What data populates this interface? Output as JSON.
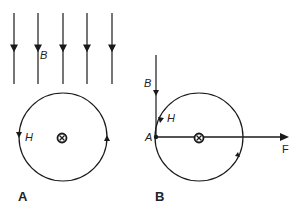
{
  "panels": [
    {
      "id": "A",
      "label": "A",
      "field_label": "B",
      "circle_label": "H",
      "center_symbol": "current-into-page",
      "field_lines_count": 5
    },
    {
      "id": "B",
      "label": "B",
      "field_label": "B",
      "circle_label": "H",
      "point_label": "A",
      "force_label": "F",
      "center_symbol": "current-into-page"
    }
  ],
  "colors": {
    "stroke": "#1a1a1a",
    "background": "#ffffff"
  }
}
